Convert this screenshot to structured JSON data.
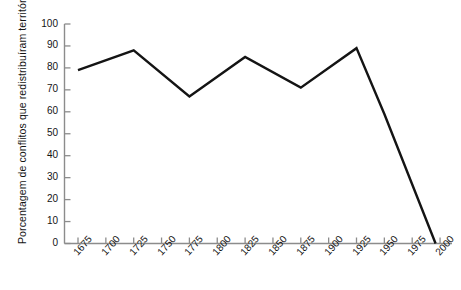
{
  "chart_data": {
    "type": "line",
    "title": "",
    "subtitle": "",
    "xlabel": "",
    "ylabel": "Porcentagem de conflitos que redistribuíram território",
    "x": [
      1675,
      1700,
      1725,
      1750,
      1775,
      1800,
      1825,
      1850,
      1875,
      1900,
      1925,
      1950,
      1975,
      2000
    ],
    "values": [
      79,
      84,
      88,
      77,
      67,
      76,
      85,
      78,
      71,
      80,
      89,
      59,
      27,
      0
    ],
    "series": [
      {
        "name": "Porcentagem de conflitos que redistribuíram território",
        "values": [
          79,
          84,
          88,
          77,
          67,
          76,
          85,
          78,
          71,
          80,
          89,
          59,
          27,
          0
        ]
      }
    ],
    "vertices": [
      {
        "x": 1675,
        "y": 79
      },
      {
        "x": 1725,
        "y": 88
      },
      {
        "x": 1775,
        "y": 67
      },
      {
        "x": 1825,
        "y": 85
      },
      {
        "x": 1875,
        "y": 71
      },
      {
        "x": 1925,
        "y": 89
      },
      {
        "x": 1950,
        "y": 59
      },
      {
        "x": 1996,
        "y": 0
      }
    ],
    "xlim": [
      1675,
      2000
    ],
    "ylim": [
      0,
      100
    ],
    "xticks": [
      "1675",
      "1700",
      "1725",
      "1750",
      "1775",
      "1800",
      "1825",
      "1850",
      "1875",
      "1900",
      "1925",
      "1950",
      "1975",
      "2000"
    ],
    "yticks": [
      "0",
      "10",
      "20",
      "30",
      "40",
      "50",
      "60",
      "70",
      "80",
      "90",
      "100"
    ],
    "grid": false,
    "legend": false,
    "legend_position": "none",
    "line_color": "#141414",
    "axis_color": "#8c8c8c"
  }
}
